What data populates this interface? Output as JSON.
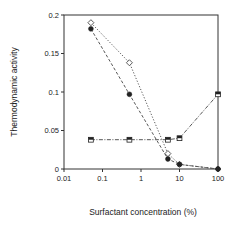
{
  "chart_data": {
    "type": "line",
    "title": "",
    "xlabel": "Surfactant concentration (%)",
    "ylabel": "Thermodynamic activity",
    "xscale": "log",
    "xlim": [
      0.01,
      100
    ],
    "ylim": [
      0,
      0.2
    ],
    "grid": false,
    "legend": null,
    "x_ticks": [
      0.01,
      0.1,
      1,
      10,
      100
    ],
    "x_tick_labels": [
      "0.01",
      "0.1",
      "1",
      "10",
      "100"
    ],
    "y_ticks": [
      0,
      0.05,
      0.1,
      0.15,
      0.2
    ],
    "y_tick_labels": [
      "0",
      "0.05",
      "0.1",
      "0.15",
      "0.2"
    ],
    "series": [
      {
        "name": "open-diamond",
        "marker": "diamond-open",
        "line_style": "dotted",
        "x": [
          0.05,
          0.5,
          5,
          10,
          100
        ],
        "values": [
          0.19,
          0.138,
          0.02,
          0.006,
          0.0
        ]
      },
      {
        "name": "filled-circle",
        "marker": "circle-filled",
        "line_style": "dashed",
        "x": [
          0.05,
          0.5,
          5,
          10,
          100
        ],
        "values": [
          0.182,
          0.097,
          0.013,
          0.006,
          0.0
        ]
      },
      {
        "name": "half-filled-square",
        "marker": "square-half",
        "line_style": "dash-dot",
        "x": [
          0.05,
          0.5,
          5,
          10,
          100
        ],
        "values": [
          0.038,
          0.038,
          0.038,
          0.04,
          0.097
        ]
      }
    ]
  },
  "labels": {
    "xlabel": "Surfactant concentration (%)",
    "ylabel": "Thermodynamic activity"
  }
}
